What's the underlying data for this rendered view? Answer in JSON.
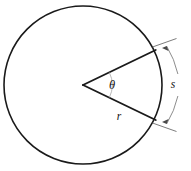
{
  "figure": {
    "type": "geometry-diagram",
    "colors": {
      "circle_stroke": "#1a1a1a",
      "radius_stroke": "#1a1a1a",
      "angle_arc_stroke": "#9a9a9a",
      "dimension_stroke": "#6e6e6e",
      "background": "#ffffff",
      "label_color": "#111111"
    },
    "circle": {
      "center_x": 83,
      "center_y": 85,
      "radius": 79
    },
    "sector": {
      "vertex_x": 83,
      "vertex_y": 85,
      "upper_endpoint_x": 155,
      "upper_endpoint_y": 51,
      "lower_endpoint_x": 155,
      "lower_endpoint_y": 121,
      "angle_degrees": 51
    },
    "angle_arc": {
      "radius": 29
    },
    "dimension_arc": {
      "radius": 95,
      "gap_label": true
    },
    "labels": {
      "theta": "θ",
      "theta_name": "central-angle-theta",
      "radius": "r",
      "radius_name": "radius-r",
      "arc_length": "s",
      "arc_length_name": "arc-length-s"
    },
    "label_positions": {
      "theta_x": 112,
      "theta_y": 86,
      "radius_x": 119,
      "radius_y": 117,
      "arc_length_x": 173,
      "arc_length_y": 85
    }
  }
}
